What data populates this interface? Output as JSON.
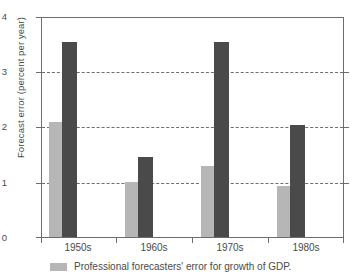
{
  "chart_data": {
    "type": "bar",
    "title": "",
    "subtitle": "",
    "xlabel": "",
    "ylabel": "Forecast error (percent per year)",
    "categories": [
      "1950s",
      "1960s",
      "1970s",
      "1980s"
    ],
    "series": [
      {
        "name": "Professional forecasters' error for growth of GDP.",
        "color": "#b6b6b6",
        "values": [
          2.1,
          1.0,
          1.3,
          0.92
        ]
      },
      {
        "name": "",
        "color": "#4a4a4a",
        "values": [
          3.55,
          1.45,
          3.55,
          2.03
        ]
      }
    ],
    "ylim": [
      0,
      4
    ],
    "yticks": [
      0,
      1,
      2,
      3,
      4
    ],
    "ytick_labels": [
      "0",
      "1",
      "2",
      "3",
      "4"
    ],
    "grid": "horizontal-dashed",
    "gridline_values": [
      1,
      2,
      3
    ],
    "legend_position": "bottom-left",
    "legend": [
      {
        "label": "Professional forecasters' error for growth of GDP.",
        "color": "#b6b6b6"
      }
    ],
    "annotations": []
  },
  "colors": {
    "light_bar": "#b6b6b6",
    "dark_bar": "#4a4a4a",
    "axis": "#6d6d6d",
    "grid": "#555555",
    "text": "#4a4a4a",
    "background": "#ffffff"
  }
}
